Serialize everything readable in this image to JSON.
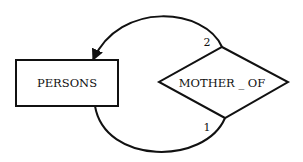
{
  "diagram": {
    "type": "entity-relationship",
    "entities": [
      {
        "id": "persons",
        "label": "PERSONS",
        "shape": "rectangle"
      }
    ],
    "relationships": [
      {
        "id": "mother_of",
        "label": "MOTHER _ OF",
        "shape": "diamond"
      }
    ],
    "edges": [
      {
        "from": "mother_of",
        "to": "persons",
        "role_label": "2",
        "arrow": true,
        "position": "top"
      },
      {
        "from": "persons",
        "to": "mother_of",
        "role_label": "1",
        "arrow": false,
        "position": "bottom"
      }
    ],
    "colors": {
      "stroke": "#111111",
      "background": "#ffffff"
    }
  }
}
